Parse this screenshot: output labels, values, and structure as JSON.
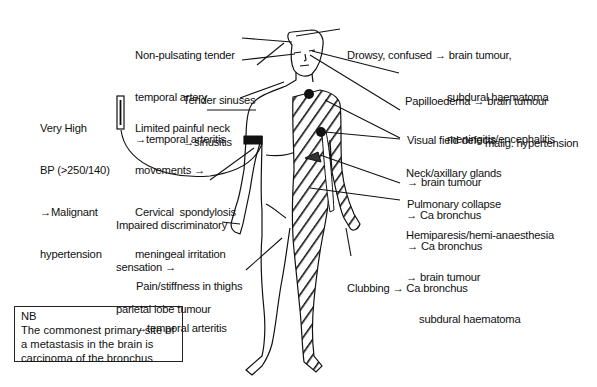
{
  "diagram": {
    "colors": {
      "ink": "#111111",
      "background": "#ffffff"
    },
    "labels": [
      {
        "id": "temporal-artery",
        "lines": [
          "Non-pulsating tender",
          "temporal artery",
          "→temporal arteritis"
        ]
      },
      {
        "id": "sinuses",
        "lines": [
          "Tender sinuses",
          "→sinusitis"
        ]
      },
      {
        "id": "neck-movements",
        "lines": [
          "Limited painful neck",
          "movements →",
          "Cervical  spondylosis",
          "meningeal irritation"
        ]
      },
      {
        "id": "blood-pressure",
        "lines": [
          "Very High",
          "BP (>250/140)",
          "→Malignant",
          "hypertension"
        ]
      },
      {
        "id": "discriminatory",
        "lines": [
          "Impaired discriminatory",
          "sensation →",
          "parietal lobe tumour"
        ]
      },
      {
        "id": "thighs",
        "lines": [
          "Pain/stiffness in thighs",
          "→temporal arteritis"
        ]
      },
      {
        "id": "drowsy",
        "lines": [
          "Drowsy, confused → brain tumour,",
          "subdural haematoma",
          "meningitis/encephalitis"
        ]
      },
      {
        "id": "papilloedema",
        "lines": [
          "Papilloedema → brain tumour",
          "malig. hypertension"
        ]
      },
      {
        "id": "visual-field",
        "lines": [
          "Visual field defects",
          "→ brain tumour"
        ]
      },
      {
        "id": "glands",
        "lines": [
          "Neck/axillary glands",
          "→ Ca bronchus"
        ]
      },
      {
        "id": "pulmonary",
        "lines": [
          "Pulmonary collapse",
          "→ Ca bronchus"
        ]
      },
      {
        "id": "hemiparesis",
        "lines": [
          "Hemiparesis/hemi-anaesthesia",
          "→ brain tumour",
          "subdural haematoma"
        ]
      },
      {
        "id": "clubbing",
        "lines": [
          "Clubbing → Ca bronchus"
        ]
      }
    ],
    "note": {
      "lines": [
        "NB",
        "The commonest primary site of",
        "a metastasis in the brain is",
        "carcinoma of the bronchus"
      ]
    },
    "icons": [
      "human-body-figure",
      "sphygmomanometer-icon",
      "bp-cuff-band",
      "lymph-node-dot",
      "collapsed-lung-wedge",
      "hemibody-hatching"
    ]
  }
}
